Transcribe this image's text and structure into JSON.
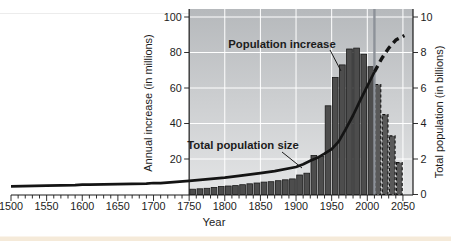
{
  "colors": {
    "plot_bg_top": "#b6b9bc",
    "plot_bg_bottom": "#e4e5e6",
    "grid": "#ffffff",
    "bar_fill": "#4d4d4d",
    "bar_outline": "#1a1a1a",
    "bar_projected_fill": "#595959",
    "line_color": "#141414",
    "marker_line": "#8d9299",
    "axis_color": "#1a1a1a",
    "text_color": "#1c1c1c",
    "page_strip": "#f5ead9"
  },
  "chart_data": {
    "type": "bar-line-combo",
    "xlabel": "Year",
    "x_ticks": [
      1500,
      1550,
      1600,
      1650,
      1700,
      1750,
      1800,
      1850,
      1900,
      1950,
      2000,
      2050
    ],
    "x_tick_labels": [
      "1500",
      "1550",
      "1600",
      "1650",
      "1700",
      "1750",
      "1800",
      "1850",
      "1900",
      "1950",
      "2000",
      "2050"
    ],
    "xlim": [
      1500,
      2050
    ],
    "grid": "on",
    "plot_start_year": 1750,
    "marker_year": 2010,
    "left_axis": {
      "label": "Annual increase (in millions)",
      "ticks": [
        20,
        40,
        60,
        80,
        100
      ],
      "tick_labels": [
        "20",
        "40",
        "60",
        "80",
        "100"
      ],
      "range": [
        0,
        105
      ]
    },
    "right_axis": {
      "label": "Total population (in billions)",
      "ticks": [
        0,
        2,
        4,
        6,
        8,
        10
      ],
      "tick_labels": [
        "0",
        "2",
        "4",
        "6",
        "8",
        "10"
      ],
      "range": [
        0,
        10.5
      ]
    },
    "bars": {
      "name": "Population increase",
      "units": "millions per year",
      "bar_width_years": 10,
      "projected_from": 2010,
      "decades": [
        1750,
        1760,
        1770,
        1780,
        1790,
        1800,
        1810,
        1820,
        1830,
        1840,
        1850,
        1860,
        1870,
        1880,
        1890,
        1900,
        1910,
        1920,
        1930,
        1940,
        1950,
        1960,
        1970,
        1980,
        1990,
        2000,
        2010,
        2020,
        2030,
        2040
      ],
      "values": [
        3,
        3.2,
        3.5,
        4,
        4.5,
        4.8,
        5,
        5.5,
        6,
        6.5,
        7,
        7.2,
        7.8,
        8.3,
        8.8,
        11,
        12,
        22,
        21.5,
        50,
        66,
        73,
        82,
        82.5,
        79,
        72,
        62,
        45,
        33,
        18
      ]
    },
    "line": {
      "name": "Total population size",
      "units": "billions",
      "points": [
        [
          1500,
          0.46
        ],
        [
          1550,
          0.5
        ],
        [
          1590,
          0.53
        ],
        [
          1600,
          0.56
        ],
        [
          1610,
          0.55
        ],
        [
          1650,
          0.58
        ],
        [
          1690,
          0.61
        ],
        [
          1700,
          0.65
        ],
        [
          1710,
          0.64
        ],
        [
          1750,
          0.77
        ],
        [
          1800,
          0.95
        ],
        [
          1820,
          1.05
        ],
        [
          1850,
          1.2
        ],
        [
          1870,
          1.32
        ],
        [
          1900,
          1.55
        ],
        [
          1910,
          1.7
        ],
        [
          1920,
          1.9
        ],
        [
          1930,
          2.07
        ],
        [
          1940,
          2.3
        ],
        [
          1950,
          2.55
        ],
        [
          1960,
          3.0
        ],
        [
          1970,
          3.7
        ],
        [
          1980,
          4.45
        ],
        [
          1990,
          5.3
        ],
        [
          2000,
          6.1
        ],
        [
          2010,
          6.9
        ]
      ],
      "projected_points": [
        [
          2010,
          6.9
        ],
        [
          2020,
          7.65
        ],
        [
          2030,
          8.25
        ],
        [
          2040,
          8.7
        ],
        [
          2052,
          8.95
        ]
      ]
    },
    "annotations": [
      {
        "text": "Population increase"
      },
      {
        "text": "Total population size"
      }
    ]
  }
}
